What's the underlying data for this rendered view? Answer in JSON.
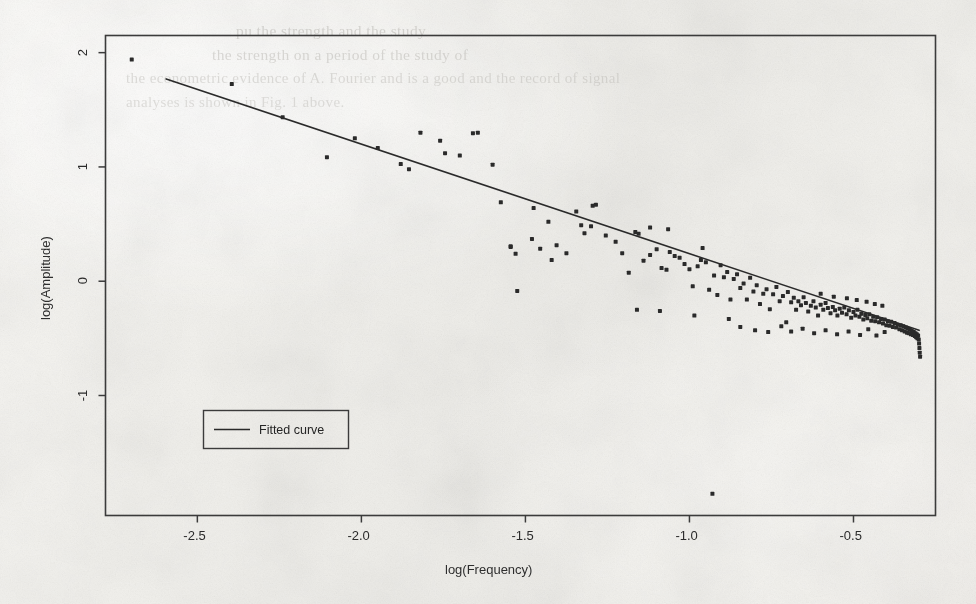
{
  "figure": {
    "kind": "scanned-figure",
    "media": "photocopied journal page",
    "background_color": "#f1f0ec",
    "ink_color": "#2b2b2b"
  },
  "ghost_text": {
    "note": "faint bleed-through text from the reverse of the page, illegible",
    "lines": [
      {
        "text": "pu the strength and the study",
        "x": 236,
        "y": 22,
        "size": 15.5,
        "opacity": 0.55
      },
      {
        "text": "the strength on a period of the study of",
        "x": 212,
        "y": 46,
        "size": 15.5,
        "opacity": 0.5
      },
      {
        "text": "the econometric evidence of A. Fourier and is a good  and the record of signal",
        "x": 126,
        "y": 70,
        "size": 15,
        "opacity": 0.45
      },
      {
        "text": "analyses is shown in Fig. 1 above.",
        "x": 126,
        "y": 94,
        "size": 15,
        "opacity": 0.42
      }
    ]
  },
  "chart_data": {
    "type": "scatter",
    "title": "",
    "subtitle": "",
    "xlabel": "log(Frequency)",
    "ylabel": "log(Amplitude)",
    "xlim": [
      -2.78,
      -0.25
    ],
    "ylim": [
      -2.05,
      2.15
    ],
    "xticks": [
      -2.5,
      -2.0,
      -1.5,
      -1.0,
      -0.5
    ],
    "xticklabels": [
      "-2.5",
      "-2.0",
      "-1.5",
      "-1.0",
      "-0.5"
    ],
    "yticks": [
      -1,
      0,
      1,
      2
    ],
    "yticklabels": [
      "-1",
      "0",
      "1",
      "2"
    ],
    "grid": false,
    "frame": true,
    "legend": {
      "position": "lower-left-inside",
      "boxed": true,
      "entries": [
        {
          "label": "Fitted curve",
          "marker": "line",
          "color": "#2b2b2b"
        }
      ]
    },
    "series": [
      {
        "name": "Spectral estimates",
        "type": "scatter",
        "marker": "square",
        "marker_size": 4,
        "color": "#2b2b2b",
        "points": [
          [
            -2.7,
            1.94
          ],
          [
            -2.395,
            1.725
          ],
          [
            -2.24,
            1.435
          ],
          [
            -2.105,
            1.085
          ],
          [
            -2.02,
            1.25
          ],
          [
            -1.95,
            1.165
          ],
          [
            -1.88,
            1.025
          ],
          [
            -1.855,
            0.98
          ],
          [
            -1.82,
            1.3
          ],
          [
            -1.76,
            1.23
          ],
          [
            -1.745,
            1.12
          ],
          [
            -1.7,
            1.1
          ],
          [
            -1.66,
            1.295
          ],
          [
            -1.645,
            1.3
          ],
          [
            -1.6,
            1.02
          ],
          [
            -1.575,
            0.69
          ],
          [
            -1.545,
            0.305
          ],
          [
            -1.53,
            0.24
          ],
          [
            -1.525,
            -0.085
          ],
          [
            -1.48,
            0.37
          ],
          [
            -1.455,
            0.285
          ],
          [
            -1.42,
            0.185
          ],
          [
            -1.405,
            0.315
          ],
          [
            -1.375,
            0.245
          ],
          [
            -1.345,
            0.61
          ],
          [
            -1.33,
            0.49
          ],
          [
            -1.32,
            0.42
          ],
          [
            -1.295,
            0.66
          ],
          [
            -1.285,
            0.67
          ],
          [
            -1.255,
            0.4
          ],
          [
            -1.225,
            0.345
          ],
          [
            -1.205,
            0.245
          ],
          [
            -1.185,
            0.075
          ],
          [
            -1.165,
            0.43
          ],
          [
            -1.155,
            0.415
          ],
          [
            -1.14,
            0.18
          ],
          [
            -1.12,
            0.23
          ],
          [
            -1.1,
            0.28
          ],
          [
            -1.085,
            0.115
          ],
          [
            -1.07,
            0.1
          ],
          [
            -1.06,
            0.255
          ],
          [
            -1.045,
            0.22
          ],
          [
            -1.03,
            0.205
          ],
          [
            -1.015,
            0.15
          ],
          [
            -1.0,
            0.105
          ],
          [
            -0.99,
            -0.045
          ],
          [
            -0.975,
            0.13
          ],
          [
            -0.965,
            0.185
          ],
          [
            -0.95,
            0.165
          ],
          [
            -0.94,
            -0.075
          ],
          [
            -0.93,
            -1.86
          ],
          [
            -0.925,
            0.05
          ],
          [
            -0.915,
            -0.12
          ],
          [
            -0.905,
            0.14
          ],
          [
            -0.895,
            0.035
          ],
          [
            -0.885,
            0.08
          ],
          [
            -0.875,
            -0.16
          ],
          [
            -0.865,
            0.02
          ],
          [
            -0.855,
            0.06
          ],
          [
            -0.845,
            -0.06
          ],
          [
            -0.835,
            -0.02
          ],
          [
            -0.825,
            -0.16
          ],
          [
            -0.815,
            0.03
          ],
          [
            -0.805,
            -0.09
          ],
          [
            -0.795,
            -0.035
          ],
          [
            -0.785,
            -0.2
          ],
          [
            -0.775,
            -0.11
          ],
          [
            -0.765,
            -0.07
          ],
          [
            -0.755,
            -0.245
          ],
          [
            -0.745,
            -0.115
          ],
          [
            -0.735,
            -0.05
          ],
          [
            -0.725,
            -0.175
          ],
          [
            -0.715,
            -0.13
          ],
          [
            -0.705,
            -0.36
          ],
          [
            -0.7,
            -0.095
          ],
          [
            -0.69,
            -0.185
          ],
          [
            -0.682,
            -0.145
          ],
          [
            -0.675,
            -0.25
          ],
          [
            -0.668,
            -0.175
          ],
          [
            -0.66,
            -0.21
          ],
          [
            -0.652,
            -0.14
          ],
          [
            -0.645,
            -0.19
          ],
          [
            -0.638,
            -0.265
          ],
          [
            -0.63,
            -0.215
          ],
          [
            -0.622,
            -0.175
          ],
          [
            -0.615,
            -0.23
          ],
          [
            -0.608,
            -0.3
          ],
          [
            -0.6,
            -0.205
          ],
          [
            -0.592,
            -0.25
          ],
          [
            -0.585,
            -0.19
          ],
          [
            -0.578,
            -0.235
          ],
          [
            -0.57,
            -0.28
          ],
          [
            -0.563,
            -0.225
          ],
          [
            -0.556,
            -0.255
          ],
          [
            -0.549,
            -0.3
          ],
          [
            -0.542,
            -0.24
          ],
          [
            -0.535,
            -0.275
          ],
          [
            -0.528,
            -0.23
          ],
          [
            -0.521,
            -0.29
          ],
          [
            -0.514,
            -0.255
          ],
          [
            -0.507,
            -0.32
          ],
          [
            -0.5,
            -0.27
          ],
          [
            -0.494,
            -0.3
          ],
          [
            -0.488,
            -0.25
          ],
          [
            -0.482,
            -0.31
          ],
          [
            -0.476,
            -0.285
          ],
          [
            -0.47,
            -0.335
          ],
          [
            -0.464,
            -0.295
          ],
          [
            -0.458,
            -0.325
          ],
          [
            -0.452,
            -0.29
          ],
          [
            -0.446,
            -0.345
          ],
          [
            -0.44,
            -0.31
          ],
          [
            -0.434,
            -0.35
          ],
          [
            -0.428,
            -0.315
          ],
          [
            -0.422,
            -0.36
          ],
          [
            -0.416,
            -0.33
          ],
          [
            -0.41,
            -0.37
          ],
          [
            -0.405,
            -0.335
          ],
          [
            -0.4,
            -0.385
          ],
          [
            -0.395,
            -0.35
          ],
          [
            -0.39,
            -0.39
          ],
          [
            -0.385,
            -0.355
          ],
          [
            -0.38,
            -0.4
          ],
          [
            -0.375,
            -0.365
          ],
          [
            -0.37,
            -0.405
          ],
          [
            -0.365,
            -0.38
          ],
          [
            -0.36,
            -0.42
          ],
          [
            -0.356,
            -0.385
          ],
          [
            -0.352,
            -0.43
          ],
          [
            -0.348,
            -0.395
          ],
          [
            -0.344,
            -0.44
          ],
          [
            -0.34,
            -0.405
          ],
          [
            -0.337,
            -0.45
          ],
          [
            -0.334,
            -0.415
          ],
          [
            -0.331,
            -0.455
          ],
          [
            -0.328,
            -0.425
          ],
          [
            -0.325,
            -0.465
          ],
          [
            -0.322,
            -0.435
          ],
          [
            -0.319,
            -0.47
          ],
          [
            -0.316,
            -0.445
          ],
          [
            -0.313,
            -0.48
          ],
          [
            -0.311,
            -0.455
          ],
          [
            -0.309,
            -0.49
          ],
          [
            -0.307,
            -0.465
          ],
          [
            -0.305,
            -0.5
          ],
          [
            -0.303,
            -0.475
          ],
          [
            -0.301,
            -0.51
          ],
          [
            -0.3,
            -0.545
          ],
          [
            -0.299,
            -0.585
          ],
          [
            -0.298,
            -0.625
          ],
          [
            -0.297,
            -0.66
          ],
          [
            -1.545,
            0.3
          ],
          [
            -1.3,
            0.48
          ],
          [
            -1.16,
            -0.25
          ],
          [
            -1.09,
            -0.26
          ],
          [
            -0.985,
            -0.3
          ],
          [
            -0.88,
            -0.33
          ],
          [
            -0.845,
            -0.4
          ],
          [
            -0.8,
            -0.43
          ],
          [
            -0.76,
            -0.445
          ],
          [
            -0.72,
            -0.395
          ],
          [
            -0.69,
            -0.44
          ],
          [
            -0.655,
            -0.415
          ],
          [
            -0.62,
            -0.455
          ],
          [
            -0.585,
            -0.43
          ],
          [
            -0.55,
            -0.465
          ],
          [
            -0.515,
            -0.44
          ],
          [
            -0.48,
            -0.47
          ],
          [
            -0.455,
            -0.42
          ],
          [
            -0.43,
            -0.475
          ],
          [
            -0.405,
            -0.445
          ],
          [
            -1.475,
            0.64
          ],
          [
            -1.43,
            0.52
          ],
          [
            -1.12,
            0.47
          ],
          [
            -1.065,
            0.455
          ],
          [
            -0.96,
            0.29
          ],
          [
            -0.6,
            -0.11
          ],
          [
            -0.56,
            -0.135
          ],
          [
            -0.52,
            -0.15
          ],
          [
            -0.49,
            -0.165
          ],
          [
            -0.46,
            -0.18
          ],
          [
            -0.435,
            -0.2
          ],
          [
            -0.412,
            -0.215
          ]
        ]
      },
      {
        "name": "Fitted curve",
        "type": "line",
        "color": "#2b2b2b",
        "linewidth": 1.6,
        "endpoints": [
          [
            -2.595,
            1.77
          ],
          [
            -0.3,
            -0.43
          ]
        ],
        "slope": -0.958,
        "intercept": -0.717
      }
    ]
  }
}
